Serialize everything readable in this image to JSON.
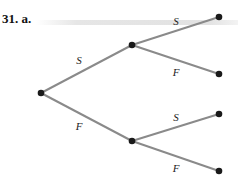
{
  "problem": {
    "number": "31.",
    "part": "a."
  },
  "tree": {
    "edge_color": "#8a8a8a",
    "node_color": "#1a1a1a",
    "nodes": [
      {
        "id": "root",
        "x": 41,
        "y": 93
      },
      {
        "id": "S",
        "x": 132,
        "y": 45
      },
      {
        "id": "F",
        "x": 132,
        "y": 141
      },
      {
        "id": "SS",
        "x": 219,
        "y": 17
      },
      {
        "id": "SF",
        "x": 219,
        "y": 74
      },
      {
        "id": "FS",
        "x": 219,
        "y": 114
      },
      {
        "id": "FF",
        "x": 219,
        "y": 171
      }
    ],
    "edges": [
      {
        "from": "root",
        "to": "S",
        "label": "S",
        "lx": 79,
        "ly": 64
      },
      {
        "from": "root",
        "to": "F",
        "label": "F",
        "lx": 79,
        "ly": 130
      },
      {
        "from": "S",
        "to": "SS",
        "label": "S",
        "lx": 176,
        "ly": 25
      },
      {
        "from": "S",
        "to": "SF",
        "label": "F",
        "lx": 176,
        "ly": 76
      },
      {
        "from": "F",
        "to": "FS",
        "label": "S",
        "lx": 176,
        "ly": 121
      },
      {
        "from": "F",
        "to": "FF",
        "label": "F",
        "lx": 176,
        "ly": 172
      }
    ]
  }
}
